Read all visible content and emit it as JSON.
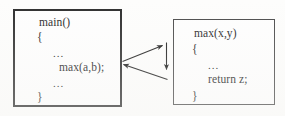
{
  "diagram": {
    "caller_box": {
      "name": "main-function-box",
      "lines": [
        "main()",
        "{",
        "...",
        "max(a,b);",
        "...",
        "}"
      ]
    },
    "callee_box": {
      "name": "max-function-box",
      "lines": [
        "max(x,y)",
        "{",
        "...",
        "return z;",
        "}"
      ]
    },
    "arrows": [
      {
        "name": "call-arrow",
        "direction": "left-to-right"
      },
      {
        "name": "execute-arrow",
        "direction": "downward"
      },
      {
        "name": "return-arrow",
        "direction": "right-to-left"
      }
    ],
    "colors": {
      "border": "#2e2e2e",
      "text": "#262626",
      "arrow": "#1f1f1f",
      "background": "#fdfdfc"
    }
  }
}
